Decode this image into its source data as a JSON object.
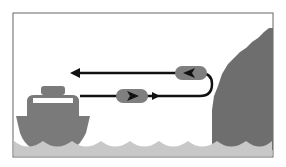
{
  "diagram": {
    "colors": {
      "frame": "#666666",
      "water": "#c8c8c8",
      "boat": "#7a7a7a",
      "cliff": "#6e6e6e",
      "arrow": "#111111",
      "pill": "#7f7f7f",
      "background": "#ffffff"
    },
    "elements": [
      "boat",
      "cliff",
      "water",
      "outbound-arrow",
      "return-arrow",
      "u-turn"
    ]
  }
}
